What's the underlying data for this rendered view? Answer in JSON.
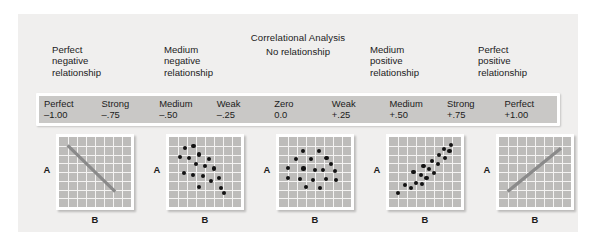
{
  "figure": {
    "title": "Correlational Analysis",
    "no_relationship_label": "No relationship",
    "axis_y_label": "A",
    "axis_x_label": "B",
    "background_color": "#f0efee",
    "scalebar_color": "#c9c8c6",
    "plot_grid_color": "#bdbcba",
    "gridline_color": "#f4f3f2",
    "dot_color": "#121212",
    "line_color": "#8a8a8a"
  },
  "captions": [
    {
      "line1": "Perfect",
      "line2": "negative",
      "line3": "relationship"
    },
    {
      "line1": "Medium",
      "line2": "negative",
      "line3": "relationship"
    },
    {
      "line1": "Medium",
      "line2": "positive",
      "line3": "relationship"
    },
    {
      "line1": "Perfect",
      "line2": "positive",
      "line3": "relationship"
    }
  ],
  "scale": [
    {
      "label": "Perfect",
      "value": "–1.00"
    },
    {
      "label": "Strong",
      "value": "–.75"
    },
    {
      "label": "Medium",
      "value": "–.50"
    },
    {
      "label": "Weak",
      "value": "–.25"
    },
    {
      "label": "Zero",
      "value": "0.0"
    },
    {
      "label": "Weak",
      "value": "+.25"
    },
    {
      "label": "Medium",
      "value": "+.50"
    },
    {
      "label": "Strong",
      "value": "+.75"
    },
    {
      "label": "Perfect",
      "value": "+1.00"
    }
  ],
  "chart_data": [
    {
      "type": "scatter",
      "name": "perfect-negative",
      "correlation": -1.0,
      "xlabel": "B",
      "ylabel": "A",
      "xlim": [
        0,
        100
      ],
      "ylim": [
        0,
        100
      ],
      "grid": true,
      "grid_divisions": 8,
      "line": {
        "x1": 12,
        "y1": 88,
        "x2": 78,
        "y2": 22
      },
      "points": []
    },
    {
      "type": "scatter",
      "name": "medium-negative",
      "correlation": -0.5,
      "xlabel": "B",
      "ylabel": "A",
      "xlim": [
        0,
        100
      ],
      "ylim": [
        0,
        100
      ],
      "grid": true,
      "grid_divisions": 8,
      "points": [
        [
          22,
          84
        ],
        [
          34,
          87
        ],
        [
          15,
          72
        ],
        [
          28,
          70
        ],
        [
          42,
          75
        ],
        [
          37,
          62
        ],
        [
          55,
          69
        ],
        [
          50,
          58
        ],
        [
          21,
          48
        ],
        [
          33,
          46
        ],
        [
          47,
          44
        ],
        [
          62,
          55
        ],
        [
          58,
          37
        ],
        [
          42,
          28
        ],
        [
          69,
          41
        ],
        [
          72,
          27
        ],
        [
          76,
          20
        ]
      ]
    },
    {
      "type": "scatter",
      "name": "no-relationship",
      "correlation": 0.0,
      "xlabel": "B",
      "ylabel": "A",
      "xlim": [
        0,
        100
      ],
      "ylim": [
        0,
        100
      ],
      "grid": true,
      "grid_divisions": 8,
      "points": [
        [
          33,
          80
        ],
        [
          55,
          80
        ],
        [
          24,
          68
        ],
        [
          44,
          68
        ],
        [
          66,
          70
        ],
        [
          72,
          61
        ],
        [
          12,
          56
        ],
        [
          34,
          55
        ],
        [
          50,
          53
        ],
        [
          61,
          53
        ],
        [
          78,
          52
        ],
        [
          13,
          42
        ],
        [
          29,
          40
        ],
        [
          47,
          39
        ],
        [
          65,
          40
        ],
        [
          79,
          38
        ],
        [
          38,
          28
        ],
        [
          57,
          27
        ]
      ]
    },
    {
      "type": "scatter",
      "name": "medium-positive",
      "correlation": 0.5,
      "xlabel": "B",
      "ylabel": "A",
      "xlim": [
        0,
        100
      ],
      "ylim": [
        0,
        100
      ],
      "grid": true,
      "grid_divisions": 8,
      "points": [
        [
          13,
          20
        ],
        [
          22,
          32
        ],
        [
          30,
          27
        ],
        [
          38,
          34
        ],
        [
          46,
          33
        ],
        [
          34,
          50
        ],
        [
          44,
          46
        ],
        [
          52,
          41
        ],
        [
          48,
          58
        ],
        [
          56,
          54
        ],
        [
          62,
          48
        ],
        [
          60,
          66
        ],
        [
          68,
          62
        ],
        [
          70,
          74
        ],
        [
          78,
          70
        ],
        [
          76,
          83
        ],
        [
          84,
          80
        ],
        [
          86,
          88
        ]
      ]
    },
    {
      "type": "scatter",
      "name": "perfect-positive",
      "correlation": 1.0,
      "xlabel": "B",
      "ylabel": "A",
      "xlim": [
        0,
        100
      ],
      "ylim": [
        0,
        100
      ],
      "grid": true,
      "grid_divisions": 8,
      "line": {
        "x1": 12,
        "y1": 22,
        "x2": 86,
        "y2": 84
      },
      "points": []
    }
  ]
}
